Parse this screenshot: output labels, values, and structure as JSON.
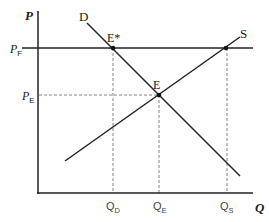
{
  "diagram": {
    "type": "supply-demand-price-floor",
    "axes": {
      "y_label": "P",
      "x_label": "Q"
    },
    "curves": {
      "demand_label": "D",
      "supply_label": "S"
    },
    "price_levels": {
      "floor_label_main": "P",
      "floor_label_sub": "F",
      "equilibrium_label_main": "P",
      "equilibrium_label_sub": "E"
    },
    "points": {
      "floor_point_label": "E*",
      "equilibrium_point_label": "E"
    },
    "quantities": {
      "qd_main": "Q",
      "qd_sub": "D",
      "qe_main": "Q",
      "qe_sub": "E",
      "qs_main": "Q",
      "qs_sub": "S"
    },
    "colors": {
      "line": "#222222",
      "dashed": "#555555"
    }
  }
}
